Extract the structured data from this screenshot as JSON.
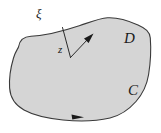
{
  "figure": {
    "type": "complex-analysis-contour-diagram",
    "caption_labels": {
      "boundary_point": "ξ",
      "interior_point": "z",
      "region": "D",
      "contour": "C"
    },
    "colors": {
      "region_fill": "#d5d5d5",
      "boundary_stroke": "#3a3a3a",
      "label_color": "#1a1a1a",
      "background": "#ffffff"
    },
    "region": {
      "name": "D",
      "fill": "#d5d5d5",
      "outline_path": "M 18.5 47 C 19.5 40 24 36.5 31 36.2 C 45 35.6 62 31.5 80 25.5 C 92 21.4 100 18.2 107.5 17.8 C 118 17.2 128 20.5 138 25.0 C 145.5 28.4 149.8 31.6 150.3 38.0 C 151.2 49.5 150.6 62 148.6 74.5 C 147.0 84.6 143.0 93.5 136.0 101.5 C 128.5 110.0 120.0 115.6 110.0 118.0 C 96.0 121.3 80.0 121.8 63.0 120.0 C 46.0 118.2 33.0 115.0 24.0 110.0 C 15.0 105.0 10.3 98.0 9.6 88.0 C 9.0 78.5 10.5 68.0 13.5 58.0 C 15.6 51.0 17.8 49.0 18.5 47 Z"
    },
    "vectors": {
      "radius_segment": {
        "name": "xi-to-z-segment",
        "from": {
          "x": 62.5,
          "y": 27.5
        },
        "to": {
          "x": 70.5,
          "y": 57.5
        }
      },
      "direction_arrow": {
        "name": "z-direction-arrow",
        "from": {
          "x": 70.5,
          "y": 57.5
        },
        "to": {
          "x": 92.5,
          "y": 34.5
        }
      },
      "contour_orientation_arrow": {
        "name": "contour-direction-marker",
        "position": {
          "x": 78,
          "y": 117
        },
        "direction": "right",
        "meaning": "counterclockwise-positive-orientation"
      }
    }
  }
}
